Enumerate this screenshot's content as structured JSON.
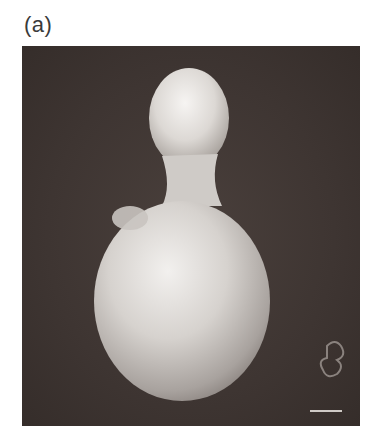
{
  "figure": {
    "panel_label": "(a)",
    "scale_bar": {
      "visible": true,
      "label": ""
    },
    "colors": {
      "background": "#3e3532",
      "cell": "#d8d4d0",
      "page": "#ffffff"
    }
  }
}
